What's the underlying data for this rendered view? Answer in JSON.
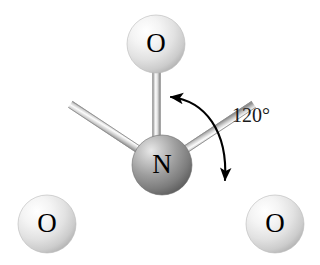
{
  "figure": {
    "background_color": "#ffffff"
  },
  "molecule": {
    "central_atom": {
      "element": "N",
      "label": "N",
      "name": "nitrogen",
      "color": "#8f8f8f",
      "highlight_color": "#d8d8d8",
      "shadow_color": "#585858",
      "cx": 162,
      "cy": 165,
      "r": 30
    },
    "terminal_atoms": [
      {
        "element": "O",
        "label": "O",
        "name": "oxygen-top",
        "color": "#e2e2e2",
        "highlight_color": "#ffffff",
        "shadow_color": "#a8a8a8",
        "cx": 156,
        "cy": 44,
        "r": 29
      },
      {
        "element": "O",
        "label": "O",
        "name": "oxygen-bottom-left",
        "color": "#e2e2e2",
        "highlight_color": "#ffffff",
        "shadow_color": "#a8a8a8",
        "cx": 47,
        "cy": 224,
        "r": 29
      },
      {
        "element": "O",
        "label": "O",
        "name": "oxygen-bottom-right",
        "color": "#e2e2e2",
        "highlight_color": "#ffffff",
        "shadow_color": "#a8a8a8",
        "cx": 275,
        "cy": 224,
        "r": 29
      }
    ],
    "bonds": [
      {
        "name": "bond-n-o-top",
        "from": "N",
        "to": "O-top"
      },
      {
        "name": "bond-n-o-bottom-left",
        "from": "N",
        "to": "O-bottom-left"
      },
      {
        "name": "bond-n-o-bottom-right",
        "from": "N",
        "to": "O-bottom-right"
      }
    ],
    "bond_color": "#b0b0b0",
    "bond_highlight_color": "#fdfdfd"
  },
  "annotation": {
    "angle_label": "120°",
    "angle_value": 120,
    "angle_unit": "degrees",
    "arc_color": "#000000",
    "arrow_start": "bond-n-o-top",
    "arrow_end": "bond-n-o-bottom-right"
  }
}
